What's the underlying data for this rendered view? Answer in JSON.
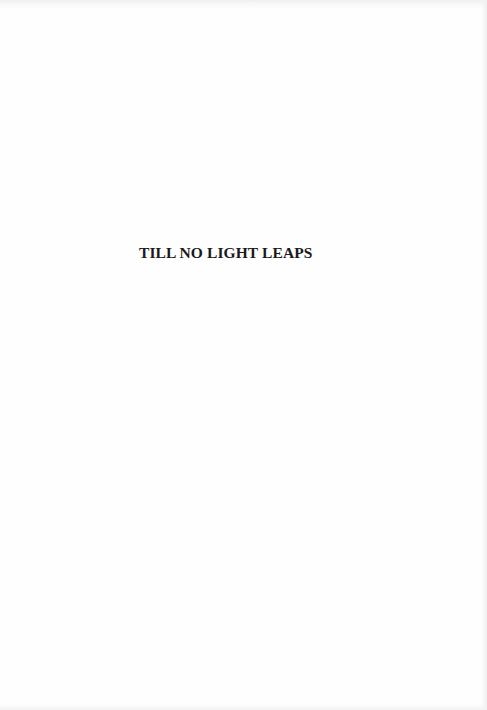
{
  "page": {
    "background_color": "#fefefe",
    "text_color": "#1a1a1a"
  },
  "half_title": {
    "text": "TILL NO LIGHT LEAPS"
  }
}
